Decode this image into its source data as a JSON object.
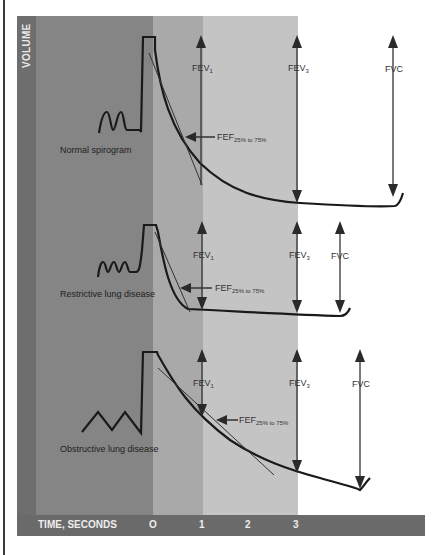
{
  "axes": {
    "y_label": "VOLUME",
    "x_label": "TIME, SECONDS",
    "x_ticks": [
      "O",
      "1",
      "2",
      "3"
    ]
  },
  "panels": [
    {
      "caption": "Normal spirogram",
      "fev1_label": "FEV",
      "fev1_sub": "1",
      "fev3_label": "FEV",
      "fev3_sub": "3",
      "fvc_label": "FVC",
      "fef_label": "FEF",
      "fef_sub": "25% to 75%"
    },
    {
      "caption": "Restrictive lung disease",
      "fev1_label": "FEV",
      "fev1_sub": "1",
      "fev3_label": "FEV",
      "fev3_sub": "3",
      "fvc_label": "FVC",
      "fef_label": "FEF",
      "fef_sub": "25% to 75%"
    },
    {
      "caption": "Obstructive lung disease",
      "fev1_label": "FEV",
      "fev1_sub": "1",
      "fev3_label": "FEV",
      "fev3_sub": "3",
      "fvc_label": "FVC",
      "fef_label": "FEF",
      "fef_sub": "25% to 75%"
    }
  ],
  "colors": {
    "volume_band": "#6e6e6e",
    "pre_zone": "#858585",
    "zone_0_1": "#a9a9a9",
    "zone_1_3": "#c4c4c4",
    "curve": "#1a1a1a"
  }
}
